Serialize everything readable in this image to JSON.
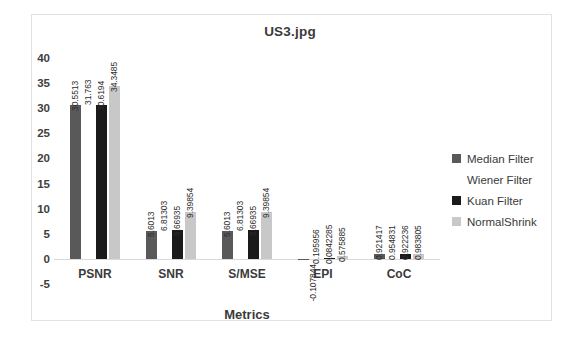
{
  "chart_data": {
    "type": "bar",
    "title": "US3.jpg",
    "xlabel": "Metrics",
    "ylabel": "",
    "categories": [
      "PSNR",
      "SNR",
      "S/MSE",
      "EPI",
      "CoC"
    ],
    "series": [
      {
        "name": "Median Filter",
        "color": "#595959",
        "values": [
          30.5513,
          5.6013,
          5.6013,
          -0.107844,
          0.921417
        ],
        "labels": [
          "30.5513",
          "5.6013",
          "5.6013",
          "-0.107844",
          "0.921417"
        ]
      },
      {
        "name": "Wiener  Filter",
        "color": "#ffffff",
        "values": [
          31.763,
          6.81303,
          6.81303,
          0.195956,
          0.954831
        ],
        "labels": [
          "31.763",
          "6.81303",
          "6.81303",
          "0.195956",
          "0.954831"
        ]
      },
      {
        "name": "Kuan Filter",
        "color": "#1a1a1a",
        "values": [
          30.6194,
          5.66935,
          5.66935,
          0.0842285,
          0.922236
        ],
        "labels": [
          "30.6194",
          "5.66935",
          "5.66935",
          "0.0842285",
          "0.922236"
        ]
      },
      {
        "name": "NormalShrink",
        "color": "#c8c8c8",
        "values": [
          34.3485,
          9.39854,
          9.39854,
          0.575885,
          0.983805
        ],
        "labels": [
          "34.3485",
          "9.39854",
          "9.39854",
          "0.575885",
          "0.983805"
        ]
      }
    ],
    "yticks": [
      "40",
      "35",
      "30",
      "25",
      "20",
      "15",
      "10",
      "5",
      "0",
      "-5"
    ],
    "ytick_values": [
      40,
      35,
      30,
      25,
      20,
      15,
      10,
      5,
      0,
      -5
    ],
    "ylim": [
      -5,
      40
    ],
    "grid": false,
    "legend_position": "right",
    "background": "#ffffff",
    "text_color": "#3a3a3a"
  }
}
